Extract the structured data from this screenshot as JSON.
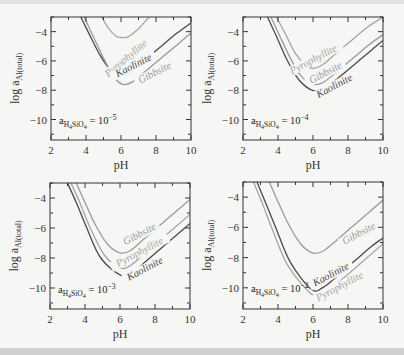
{
  "colors": {
    "background": "#f6f6f4",
    "axis": "#333333",
    "kaolinite": "#4a4a4a",
    "gibbsite": "#9a9a9a",
    "pyrophyllite": "#a5a5a5"
  },
  "chart_data": [
    {
      "type": "line",
      "panel": "top-left",
      "xlabel": "pH",
      "ylabel": "log a_Al(total)",
      "xlim": [
        2,
        10
      ],
      "ylim": [
        -11.4,
        -3.0
      ],
      "xticks": [
        2,
        4,
        6,
        8,
        10
      ],
      "yticks": [
        -4,
        -6,
        -8,
        -10
      ],
      "annotation": {
        "base": "a",
        "sub": "H4SiO4",
        "text": " = 10",
        "exp": "−5"
      },
      "series": [
        {
          "name": "Pyrophyllite",
          "color": "#a5a5a5",
          "x": [
            4.9,
            5.3,
            5.7,
            6.0,
            6.4,
            7.0,
            7.6
          ],
          "y": [
            -3.0,
            -3.8,
            -4.3,
            -4.4,
            -4.35,
            -3.8,
            -3.0
          ]
        },
        {
          "name": "Kaolinite",
          "color": "#4a4a4a",
          "x": [
            3.7,
            4.2,
            4.8,
            5.4,
            6.0,
            6.6,
            7.4,
            8.3,
            9.2,
            10.0
          ],
          "y": [
            -3.0,
            -4.2,
            -5.6,
            -6.6,
            -6.9,
            -6.7,
            -5.9,
            -5.0,
            -4.1,
            -3.4
          ]
        },
        {
          "name": "Gibbsite",
          "color": "#9a9a9a",
          "x": [
            3.9,
            4.4,
            5.0,
            5.6,
            6.1,
            6.7,
            7.5,
            8.4,
            9.3,
            10.0
          ],
          "y": [
            -3.0,
            -4.3,
            -5.8,
            -7.1,
            -7.6,
            -7.4,
            -6.6,
            -5.7,
            -4.8,
            -4.1
          ]
        }
      ],
      "labels": [
        {
          "text": "Pyrophyllite",
          "color": "#a5a5a5",
          "x": 6.4,
          "y": -6.0,
          "angle": -40
        },
        {
          "text": "Kaolinite",
          "color": "#4a4a4a",
          "x": 6.8,
          "y": -6.5,
          "angle": -27
        },
        {
          "text": "Gibbsite",
          "color": "#9a9a9a",
          "x": 8.0,
          "y": -7.0,
          "angle": -27
        }
      ]
    },
    {
      "type": "line",
      "panel": "top-right",
      "xlabel": "pH",
      "ylabel": "log a_Al(total)",
      "xlim": [
        2,
        10
      ],
      "ylim": [
        -11.4,
        -3.0
      ],
      "xticks": [
        2,
        4,
        6,
        8,
        10
      ],
      "yticks": [
        -4,
        -6,
        -8,
        -10
      ],
      "annotation": {
        "base": "a",
        "sub": "H4SiO4",
        "text": " = 10",
        "exp": "−4"
      },
      "series": [
        {
          "name": "Pyrophyllite",
          "color": "#a5a5a5",
          "x": [
            3.9,
            4.4,
            5.0,
            5.5,
            5.95,
            6.5,
            7.3,
            8.2,
            9.1,
            10.0
          ],
          "y": [
            -3.0,
            -4.1,
            -5.5,
            -6.2,
            -6.5,
            -6.3,
            -5.5,
            -4.6,
            -3.7,
            -3.0
          ]
        },
        {
          "name": "Gibbsite",
          "color": "#9a9a9a",
          "x": [
            3.6,
            4.1,
            4.7,
            5.3,
            6.0,
            6.6,
            7.4,
            8.3,
            9.2,
            10.0
          ],
          "y": [
            -3.0,
            -4.3,
            -5.8,
            -7.0,
            -7.6,
            -7.45,
            -6.7,
            -5.8,
            -4.9,
            -4.2
          ]
        },
        {
          "name": "Kaolinite",
          "color": "#4a4a4a",
          "x": [
            3.4,
            3.9,
            4.5,
            5.2,
            6.05,
            6.7,
            7.5,
            8.4,
            9.3,
            10.0
          ],
          "y": [
            -3.0,
            -4.3,
            -5.9,
            -7.3,
            -8.05,
            -7.85,
            -7.1,
            -6.2,
            -5.3,
            -4.6
          ]
        }
      ],
      "labels": [
        {
          "text": "Pyrophyllite",
          "color": "#a5a5a5",
          "x": 6.1,
          "y": -6.1,
          "angle": -28
        },
        {
          "text": "Gibbsite",
          "color": "#9a9a9a",
          "x": 6.8,
          "y": -7.0,
          "angle": -28
        },
        {
          "text": "Kaolinite",
          "color": "#4a4a4a",
          "x": 7.3,
          "y": -7.9,
          "angle": -28
        }
      ]
    },
    {
      "type": "line",
      "panel": "bottom-left",
      "xlabel": "pH",
      "ylabel": "log a_Al(total)",
      "xlim": [
        2,
        10
      ],
      "ylim": [
        -11.4,
        -3.0
      ],
      "xticks": [
        2,
        4,
        6,
        8,
        10
      ],
      "yticks": [
        -4,
        -6,
        -8,
        -10
      ],
      "annotation": {
        "base": "a",
        "sub": "H4SiO4",
        "text": " = 10",
        "exp": "−3"
      },
      "series": [
        {
          "name": "Gibbsite",
          "color": "#9a9a9a",
          "x": [
            3.5,
            4.0,
            4.6,
            5.3,
            6.0,
            6.6,
            7.4,
            8.3,
            9.2,
            10.0
          ],
          "y": [
            -3.0,
            -4.3,
            -5.8,
            -7.1,
            -7.65,
            -7.5,
            -6.7,
            -5.8,
            -4.9,
            -4.1
          ]
        },
        {
          "name": "Pyrophyllite",
          "color": "#a5a5a5",
          "x": [
            3.2,
            3.7,
            4.3,
            5.1,
            6.0,
            6.6,
            7.4,
            8.3,
            9.2,
            10.0
          ],
          "y": [
            -3.0,
            -4.3,
            -6.0,
            -7.8,
            -8.65,
            -8.5,
            -7.7,
            -6.8,
            -5.9,
            -5.1
          ]
        },
        {
          "name": "Kaolinite",
          "color": "#4a4a4a",
          "x": [
            3.0,
            3.5,
            4.1,
            4.9,
            6.05,
            6.7,
            7.5,
            8.4,
            9.3,
            10.0
          ],
          "y": [
            -3.0,
            -4.3,
            -6.0,
            -8.0,
            -9.15,
            -9.0,
            -8.2,
            -7.3,
            -6.4,
            -5.7
          ]
        }
      ],
      "labels": [
        {
          "text": "Gibbsite",
          "color": "#9a9a9a",
          "x": 7.2,
          "y": -6.6,
          "angle": -28
        },
        {
          "text": "Pyrophyllite",
          "color": "#a5a5a5",
          "x": 7.2,
          "y": -7.8,
          "angle": -28
        },
        {
          "text": "Kaolinite",
          "color": "#4a4a4a",
          "x": 7.5,
          "y": -8.9,
          "angle": -28
        }
      ]
    },
    {
      "type": "line",
      "panel": "bottom-right",
      "xlabel": "pH",
      "ylabel": "log a_Al(total)",
      "xlim": [
        2,
        10
      ],
      "ylim": [
        -11.4,
        -3.0
      ],
      "xticks": [
        2,
        4,
        6,
        8,
        10
      ],
      "yticks": [
        -4,
        -6,
        -8,
        -10
      ],
      "annotation": {
        "base": "a",
        "sub": "H4SiO4",
        "text": " = 10",
        "exp": "−2"
      },
      "series": [
        {
          "name": "Gibbsite",
          "color": "#9a9a9a",
          "x": [
            3.5,
            4.0,
            4.6,
            5.3,
            6.0,
            6.6,
            7.4,
            8.3,
            9.2,
            10.0
          ],
          "y": [
            -3.0,
            -4.3,
            -5.8,
            -7.1,
            -7.7,
            -7.55,
            -6.8,
            -5.9,
            -5.0,
            -4.2
          ]
        },
        {
          "name": "Kaolinite",
          "color": "#4a4a4a",
          "x": [
            2.8,
            3.3,
            3.9,
            4.7,
            5.9,
            6.6,
            7.5,
            8.4,
            9.3,
            10.0
          ],
          "y": [
            -3.0,
            -4.4,
            -6.1,
            -8.3,
            -10.1,
            -9.95,
            -9.1,
            -8.2,
            -7.3,
            -6.7
          ]
        },
        {
          "name": "Pyrophyllite",
          "color": "#a5a5a5",
          "x": [
            2.6,
            3.1,
            3.7,
            4.6,
            6.0,
            6.7,
            7.6,
            8.5,
            9.4,
            10.0
          ],
          "y": [
            -3.0,
            -4.4,
            -6.2,
            -8.6,
            -10.5,
            -10.35,
            -9.5,
            -8.6,
            -7.7,
            -7.1
          ]
        }
      ],
      "labels": [
        {
          "text": "Gibbsite",
          "color": "#9a9a9a",
          "x": 8.7,
          "y": -6.6,
          "angle": -28
        },
        {
          "text": "Kaolinite",
          "color": "#4a4a4a",
          "x": 7.1,
          "y": -9.3,
          "angle": -28
        },
        {
          "text": "Pyrophyllite",
          "color": "#a5a5a5",
          "x": 7.6,
          "y": -10.1,
          "angle": -28
        }
      ]
    }
  ],
  "panels_layout": [
    {
      "left": 51,
      "top": 17,
      "right": 191,
      "bottom": 140
    },
    {
      "left": 243,
      "top": 17,
      "right": 383,
      "bottom": 140
    },
    {
      "left": 50,
      "top": 183,
      "right": 190,
      "bottom": 309
    },
    {
      "left": 243,
      "top": 182,
      "right": 383,
      "bottom": 309
    }
  ]
}
